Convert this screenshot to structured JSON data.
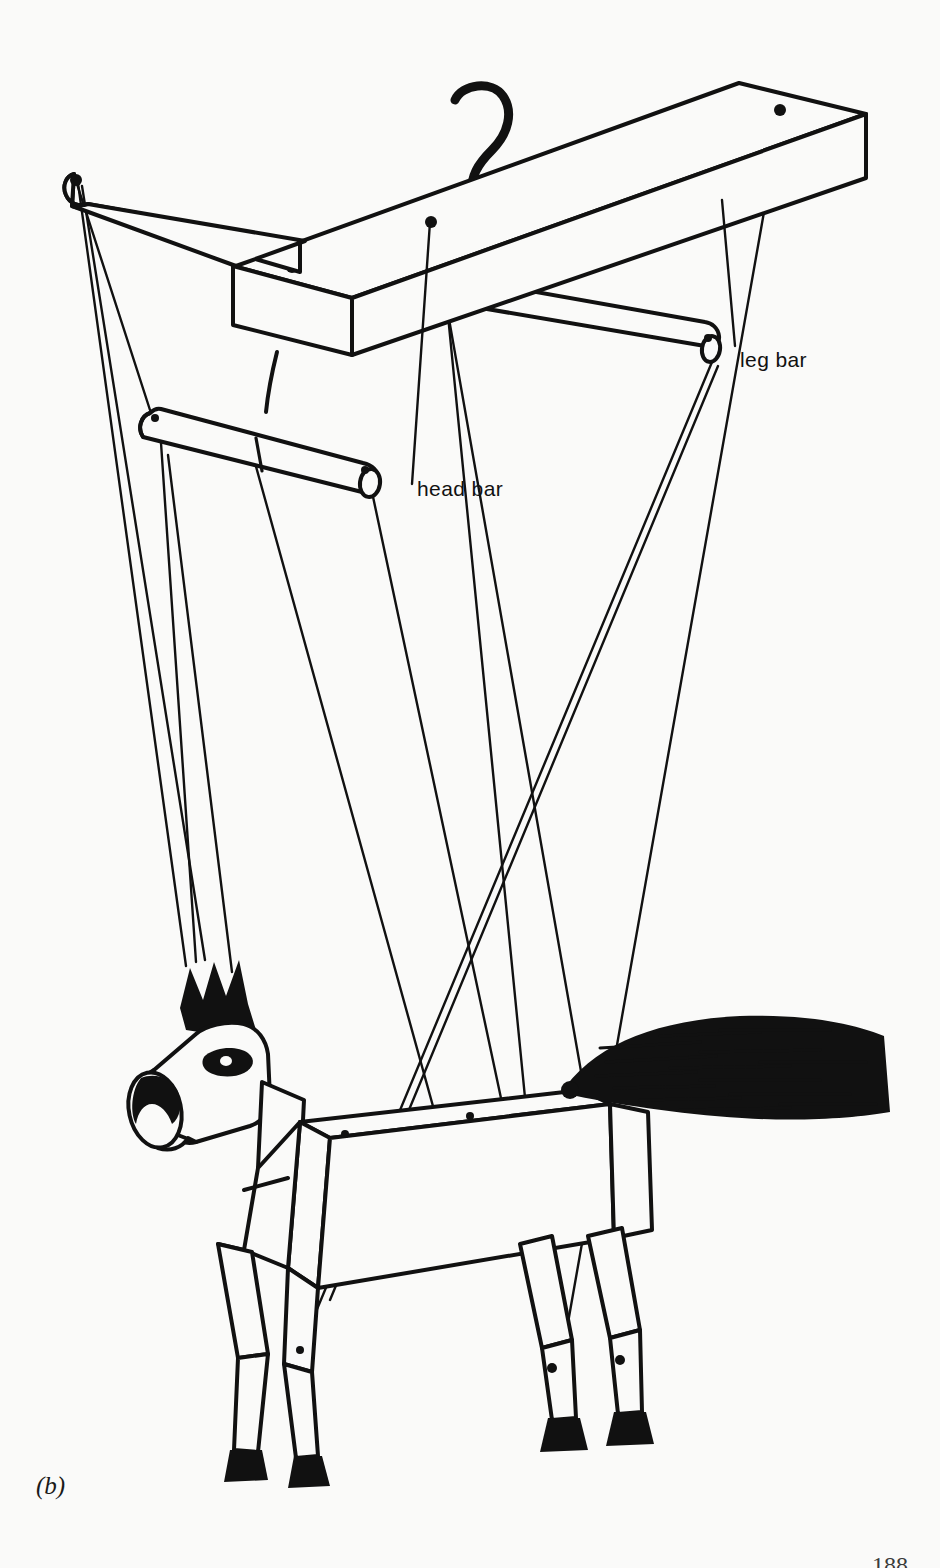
{
  "figure": {
    "caption": "(b)",
    "page_number": "188",
    "background_color": "#fafaf9",
    "ink_color": "#111111"
  },
  "labels": [
    {
      "id": "leg-bar",
      "text": "leg bar",
      "x": 740,
      "y": 348
    },
    {
      "id": "head-bar",
      "text": "head bar",
      "x": 417,
      "y": 477
    }
  ],
  "parts": {
    "main_bar": {
      "name": "main control bar",
      "icon": "wooden-beam-icon",
      "holes": 3
    },
    "hook": {
      "name": "hanging hook",
      "icon": "hook-icon"
    },
    "leg_bar": {
      "name": "leg bar",
      "icon": "dowel-icon"
    },
    "head_bar": {
      "name": "head bar",
      "icon": "dowel-icon"
    },
    "left_cross_bar": {
      "name": "left cross bar",
      "icon": "dowel-icon"
    },
    "puppet": {
      "name": "horse marionette",
      "icon": "horse-icon",
      "features": [
        "mane",
        "ears",
        "eye",
        "muzzle",
        "tail",
        "four jointed legs",
        "black hooves"
      ]
    },
    "strings": {
      "name": "control strings",
      "count": 8
    }
  }
}
